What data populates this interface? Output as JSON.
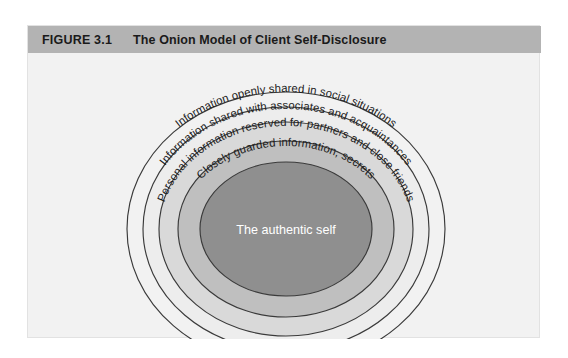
{
  "figure": {
    "number": "FIGURE 3.1",
    "title": "The Onion Model of Client Self-Disclosure",
    "header_bg": "#b3b3b3",
    "panel_bg": "#f2f2f2"
  },
  "diagram": {
    "type": "concentric-ellipses",
    "name": "onion-model",
    "rings": [
      {
        "index": 0,
        "label": "Information openly shared in social situations",
        "fill": "#f2f2f2",
        "stroke": "#3a3a3a"
      },
      {
        "index": 1,
        "label": "Information shared with associates and acquaintances",
        "fill": "#ededed",
        "stroke": "#3a3a3a"
      },
      {
        "index": 2,
        "label": "Personal information reserved for partners and close friends",
        "fill": "#d9d9d9",
        "stroke": "#3a3a3a"
      },
      {
        "index": 3,
        "label": "Closely guarded information, secrets",
        "fill": "#bfbfbf",
        "stroke": "#3a3a3a"
      }
    ],
    "core": {
      "label": "The authentic self",
      "fill": "#8f8f8f",
      "stroke": "#3a3a3a",
      "text_color": "#ffffff"
    }
  }
}
